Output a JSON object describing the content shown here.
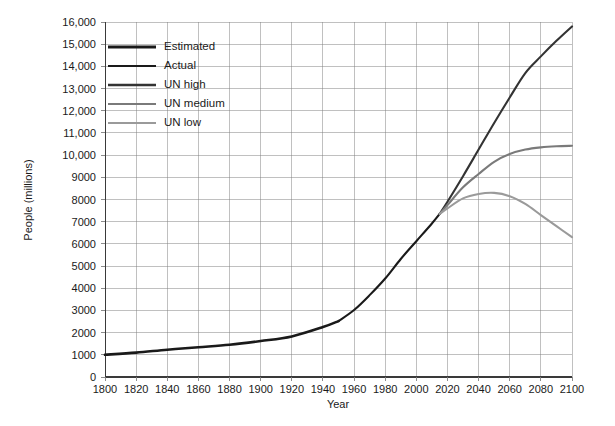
{
  "chart_data": {
    "type": "line",
    "title": "",
    "xlabel": "Year",
    "ylabel": "People (millions)",
    "xlim": [
      1800,
      2100
    ],
    "ylim": [
      0,
      16000
    ],
    "xticks": [
      1800,
      1820,
      1840,
      1860,
      1880,
      1900,
      1920,
      1940,
      1960,
      1980,
      2000,
      2020,
      2040,
      2060,
      2080,
      2100
    ],
    "xtick_labels": [
      "1800",
      "1820",
      "1840",
      "1860",
      "1880",
      "1900",
      "1920",
      "1940",
      "1960",
      "1980",
      "2000",
      "2020",
      "2040",
      "2060",
      "2080",
      "2100"
    ],
    "yticks": [
      0,
      1000,
      2000,
      3000,
      4000,
      5000,
      6000,
      7000,
      8000,
      9000,
      10000,
      11000,
      12000,
      13000,
      14000,
      15000,
      16000
    ],
    "ytick_labels": [
      "0",
      "1000",
      "2000",
      "3000",
      "4000",
      "5000",
      "6000",
      "7000",
      "8000",
      "9000",
      "10,000",
      "11,000",
      "12,000",
      "13,000",
      "14,000",
      "15,000",
      "16,000"
    ],
    "grid": true,
    "grid_color": "#808080",
    "legend_position": "top-left",
    "legend": [
      "Estimated",
      "Actual",
      "UN high",
      "UN medium",
      "UN low"
    ],
    "series": [
      {
        "name": "Estimated",
        "color": "#1a1a1a",
        "width": 2.6,
        "x": [
          1800,
          1820,
          1840,
          1860,
          1880,
          1900,
          1920,
          1940,
          1950
        ],
        "values": [
          1000,
          1100,
          1230,
          1340,
          1450,
          1620,
          1830,
          2250,
          2520
        ]
      },
      {
        "name": "Actual",
        "color": "#1a1a1a",
        "width": 2.1,
        "x": [
          1950,
          1960,
          1970,
          1980,
          1990,
          2000,
          2010,
          2015
        ],
        "values": [
          2520,
          3020,
          3690,
          4440,
          5320,
          6120,
          6920,
          7350
        ]
      },
      {
        "name": "UN high",
        "color": "#333333",
        "width": 2.1,
        "x": [
          2015,
          2020,
          2030,
          2040,
          2050,
          2060,
          2070,
          2080,
          2090,
          2100
        ],
        "values": [
          7350,
          7900,
          9050,
          10250,
          11450,
          12600,
          13700,
          14450,
          15150,
          15800
        ]
      },
      {
        "name": "UN medium",
        "color": "#7a7a7a",
        "width": 2.1,
        "x": [
          2015,
          2020,
          2030,
          2040,
          2050,
          2060,
          2070,
          2080,
          2090,
          2100
        ],
        "values": [
          7350,
          7750,
          8550,
          9150,
          9700,
          10050,
          10250,
          10350,
          10400,
          10420
        ]
      },
      {
        "name": "UN low",
        "color": "#9a9a9a",
        "width": 2.1,
        "x": [
          2015,
          2020,
          2030,
          2040,
          2050,
          2060,
          2070,
          2080,
          2090,
          2100
        ],
        "values": [
          7350,
          7600,
          8050,
          8250,
          8300,
          8150,
          7800,
          7300,
          6800,
          6300
        ]
      }
    ]
  },
  "axes": {
    "x_title": "Year",
    "y_title": "People (millions)"
  },
  "legend": {
    "items": [
      {
        "label": "Estimated",
        "color": "#1a1a1a",
        "width": 3.2
      },
      {
        "label": "Actual",
        "color": "#1a1a1a",
        "width": 2.2
      },
      {
        "label": "UN high",
        "color": "#333333",
        "width": 2.4
      },
      {
        "label": "UN medium",
        "color": "#7a7a7a",
        "width": 2.2
      },
      {
        "label": "UN low",
        "color": "#9a9a9a",
        "width": 2.2
      }
    ]
  }
}
